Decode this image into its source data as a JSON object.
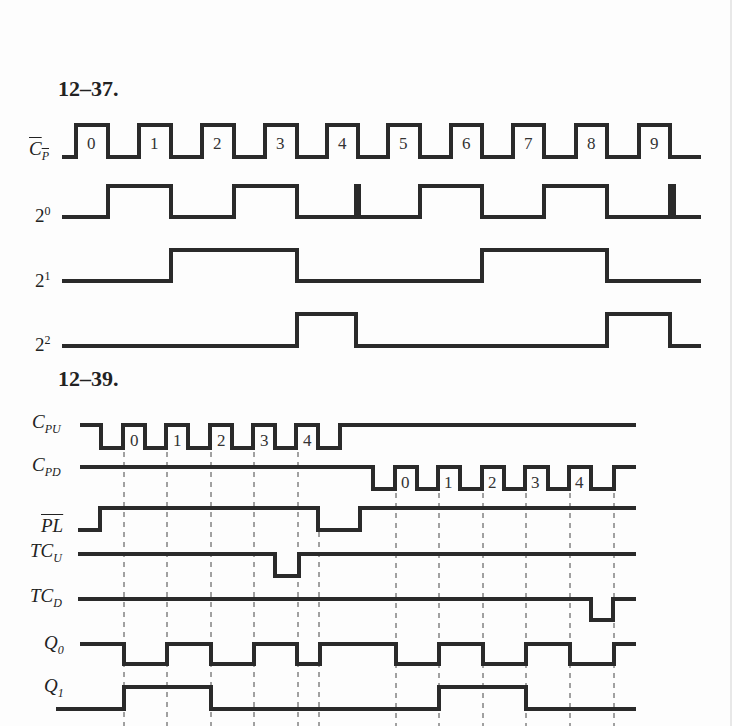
{
  "figures": [
    {
      "id": "12-37",
      "title": "12–37.",
      "signals": [
        {
          "name": "C_P_bar",
          "label_main": "C",
          "label_sub": "P",
          "overbar": true,
          "pulse_numbers": [
            "0",
            "1",
            "2",
            "3",
            "4",
            "5",
            "6",
            "7",
            "8",
            "9"
          ]
        },
        {
          "name": "2^0",
          "label_main": "2",
          "label_sup": "0"
        },
        {
          "name": "2^1",
          "label_main": "2",
          "label_sup": "1"
        },
        {
          "name": "2^2",
          "label_main": "2",
          "label_sup": "2"
        }
      ]
    },
    {
      "id": "12-39",
      "title": "12–39.",
      "signals": [
        {
          "name": "C_PU",
          "label_main": "C",
          "label_sub": "PU",
          "pulse_numbers": [
            "0",
            "1",
            "2",
            "3",
            "4"
          ]
        },
        {
          "name": "C_PD",
          "label_main": "C",
          "label_sub": "PD",
          "pulse_numbers": [
            "0",
            "1",
            "2",
            "3",
            "4"
          ]
        },
        {
          "name": "PL_bar",
          "label_main": "PL",
          "overbar": true
        },
        {
          "name": "TC_U",
          "label_main": "TC",
          "label_sub": "U"
        },
        {
          "name": "TC_D",
          "label_main": "TC",
          "label_sub": "D"
        },
        {
          "name": "Q_0",
          "label_main": "Q",
          "label_sub": "0"
        },
        {
          "name": "Q_1",
          "label_main": "Q",
          "label_sub": "1"
        }
      ]
    }
  ],
  "colors": {
    "trace": "#2a2a2a",
    "background": "#fdfdfd",
    "dashed": "#444444"
  }
}
